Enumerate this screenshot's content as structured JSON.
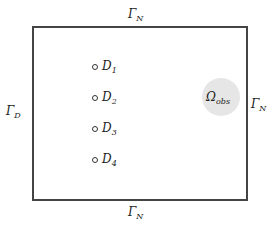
{
  "diagram": {
    "boundaries": {
      "top": {
        "symbol": "Γ",
        "sub": "N"
      },
      "bottom": {
        "symbol": "Γ",
        "sub": "N"
      },
      "left": {
        "symbol": "Γ",
        "sub": "D"
      },
      "right": {
        "symbol": "Γ",
        "sub": "N"
      }
    },
    "observation_region": {
      "symbol": "Ω",
      "sub": "obs",
      "fill": "#e6e6e6"
    },
    "sources": [
      {
        "symbol": "D",
        "sub": "1"
      },
      {
        "symbol": "D",
        "sub": "2"
      },
      {
        "symbol": "D",
        "sub": "3"
      },
      {
        "symbol": "D",
        "sub": "4"
      }
    ]
  }
}
